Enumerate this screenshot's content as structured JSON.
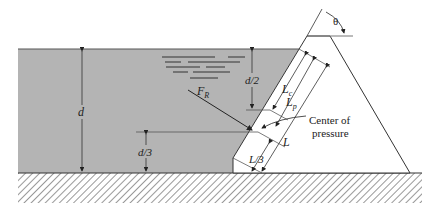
{
  "diagram": {
    "labels": {
      "theta": "θ",
      "d": "d",
      "d_half": "d/2",
      "d_third": "d/3",
      "force": "F",
      "force_sub": "R",
      "lc": "L",
      "lc_sub": "c",
      "lp": "L",
      "lp_sub": "p",
      "L": "L",
      "L_third": "L/3",
      "center_line1": "Center of",
      "center_line2": "pressure"
    },
    "colors": {
      "water": "#b4b4b4",
      "line": "#333333",
      "background": "#ffffff"
    }
  }
}
